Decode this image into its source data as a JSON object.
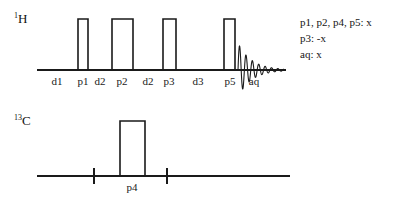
{
  "figure": {
    "type": "nmr-pulse-sequence-diagram",
    "background_color": "#ffffff",
    "line_color": "#1a1a1a"
  },
  "channels": [
    {
      "id": "proton",
      "nucleus_mass": "1",
      "nucleus_symbol": "H",
      "baseline_y": 70,
      "baseline_x_start": 37,
      "baseline_x_end": 286
    },
    {
      "id": "carbon",
      "nucleus_mass": "13",
      "nucleus_symbol": "C",
      "baseline_y": 176,
      "baseline_x_start": 37,
      "baseline_x_end": 290
    }
  ],
  "proton_pulses": [
    {
      "label": "p1",
      "x": 78,
      "width": 10,
      "height": 51
    },
    {
      "label": "p2",
      "x": 112,
      "width": 21,
      "height": 51
    },
    {
      "label": "p3",
      "x": 163,
      "width": 13,
      "height": 51
    },
    {
      "label": "p5",
      "x": 224,
      "width": 11,
      "height": 51
    }
  ],
  "carbon_pulses": [
    {
      "label": "p4",
      "x": 120,
      "width": 25,
      "height": 55
    }
  ],
  "carbon_ticks": [
    {
      "x": 94
    },
    {
      "x": 167
    }
  ],
  "proton_axis_labels": [
    {
      "text": "d1",
      "x": 57
    },
    {
      "text": "p1",
      "x": 83
    },
    {
      "text": "d2",
      "x": 100
    },
    {
      "text": "p2",
      "x": 122
    },
    {
      "text": "d2",
      "x": 148
    },
    {
      "text": "p3",
      "x": 169
    },
    {
      "text": "d3",
      "x": 198
    },
    {
      "text": "p5",
      "x": 230
    },
    {
      "text": "aq",
      "x": 254
    }
  ],
  "carbon_axis_labels": [
    {
      "text": "p4",
      "x": 132
    }
  ],
  "fid": {
    "label": "aq",
    "x_start": 238,
    "x_end": 284,
    "baseline_y": 70,
    "amplitude": 27,
    "cycles": 7.2,
    "decay": 3.4
  },
  "phases": {
    "lines": [
      "p1, p2, p4, p5: x",
      "p3: -x",
      "aq: x"
    ]
  }
}
